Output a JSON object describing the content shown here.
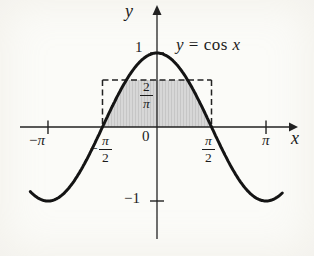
{
  "figure": {
    "curve_label": {
      "lhs": "y",
      "mid": " = cos ",
      "rhs": "x"
    },
    "axis_labels": {
      "x": "x",
      "y": "y"
    },
    "tick_labels": {
      "one": "1",
      "neg_one": "−1",
      "zero": "0",
      "pi": "π",
      "neg_pi_sign": "−",
      "neg_pi_symbol": "π"
    },
    "fractions": {
      "neg_half": {
        "sign": "−",
        "num": "π",
        "den": "2"
      },
      "pos_half": {
        "num": "π",
        "den": "2"
      },
      "avg_height": {
        "num": "2",
        "den": "π"
      }
    },
    "colors": {
      "ink": "#1b1b1b",
      "shade_base": "#d7d7d7",
      "shade_stripe": "#c6c6c6",
      "background": "#fbfbf8"
    }
  },
  "chart_data": {
    "type": "line",
    "title": "",
    "annotation": "y = cos x",
    "series": [
      {
        "name": "y = cos x",
        "function": "cos(x)",
        "x_domain": [
          -3.65,
          3.62
        ]
      }
    ],
    "x_ticks": [
      {
        "value": -3.14159,
        "label": "−π",
        "tick": true
      },
      {
        "value": -1.5708,
        "label": "−π/2",
        "tick": false
      },
      {
        "value": 0,
        "label": "0",
        "tick": false
      },
      {
        "value": 1.5708,
        "label": "π/2",
        "tick": false
      },
      {
        "value": 3.14159,
        "label": "π",
        "tick": true
      }
    ],
    "y_ticks": [
      {
        "value": 1,
        "label": "1",
        "tick": true
      },
      {
        "value": -1,
        "label": "−1",
        "tick": true
      }
    ],
    "xlim": [
      -3.95,
      4.06
    ],
    "ylim": [
      -1.51,
      1.65
    ],
    "grid": false,
    "legend": "none",
    "dashed_rectangle": {
      "x_from": -1.5708,
      "x_to": 1.5708,
      "y_from": 0,
      "height": 0.6366,
      "height_label": "2/π",
      "style": "dashed"
    },
    "shaded_region": {
      "description": "region between the x-axis and y = min(cos x, 2/π) for −π/2 ≤ x ≤ π/2"
    },
    "px_mapping": {
      "origin_x": 157,
      "origin_y": 127,
      "px_per_x_unit": 34.7,
      "px_per_y_unit": 74
    }
  }
}
